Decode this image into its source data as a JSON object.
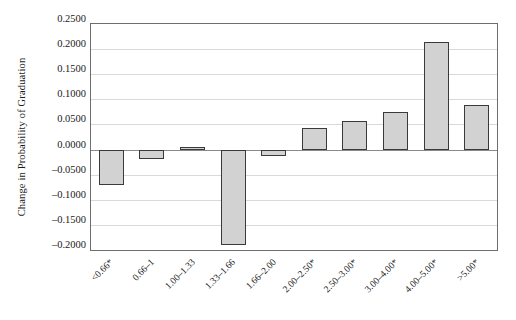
{
  "chart_data": {
    "type": "bar",
    "title": "",
    "subtitle": "",
    "xlabel": "",
    "ylabel": "Change in Probability of Graduation",
    "categories": [
      "<0.66*",
      "0.66–1",
      "1.00–1.33",
      "1.33–1.66",
      "1.66–2.00",
      "2.00–2.50*",
      "2.50–3.00*",
      "3.00–4.00*",
      "4.00–5.00*",
      ">5.00*"
    ],
    "values": [
      -0.07,
      -0.0195,
      0.002,
      -0.19,
      -0.012,
      0.043,
      0.056,
      0.0745,
      0.215,
      0.089
    ],
    "ylim": [
      -0.2,
      0.25
    ],
    "ytick_step": 0.05,
    "ytick_labels": [
      "0.2500",
      "0.2000",
      "0.1500",
      "0.1000",
      "0.0500",
      "0.0000",
      "–0.0500",
      "–0.1000",
      "–0.1500",
      "–0.2000"
    ],
    "ytick_values": [
      0.25,
      0.2,
      0.15,
      0.1,
      0.05,
      0.0,
      -0.05,
      -0.1,
      -0.15,
      -0.2
    ],
    "grid": true,
    "legend": false,
    "legend_position": "none",
    "bar_fill_color": "#d2d2d2",
    "bar_border_color": "#3a3a3a",
    "gridline_color": "#d9d9d9",
    "axis_color": "#6e6e6e",
    "plot_background": "#ffffff",
    "xtick_rotation_degrees": -45
  }
}
